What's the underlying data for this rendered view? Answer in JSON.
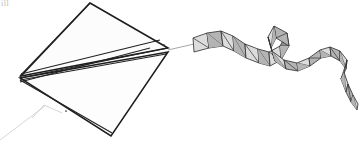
{
  "canvas": {
    "width": 360,
    "height": 142,
    "background": "#ffffff"
  },
  "artwork": {
    "title": "Kite with twisting ribbon tail",
    "medium": "pencil line drawing",
    "corner_mark": "ill",
    "palette": {
      "ink": "#1d1d1d",
      "ink_soft": "#3a3a3a",
      "facet_light": "#dcdcdc",
      "facet_mid": "#b4b4b4",
      "facet_dark": "#909090",
      "sail_fill": "#fcfcfc",
      "flying_line": "#d2d2d2",
      "bridle_line": "#c9c9c9"
    }
  },
  "kite": {
    "name": "delta kite sail",
    "outline_points": "90,3 168,48 111,136 20,78",
    "upper_panel_points": "90,3 168,48 21,76",
    "lower_panel_points": "20,78 168,52 111,136",
    "left_vertex": "20,78",
    "top_vertex": "90,3",
    "right_vertex": "168,48",
    "bottom_vertex": "111,136",
    "spars": [
      {
        "name": "spine-spar",
        "from": "20,78",
        "to": "168,48"
      },
      {
        "name": "upper-leading-edge",
        "from": "20,76",
        "to": "90,3"
      },
      {
        "name": "upper-chord-spar",
        "from": "21,74",
        "to": "160,40"
      },
      {
        "name": "mid-chord-spar",
        "from": "20,80",
        "to": "166,54"
      },
      {
        "name": "lower-cross-spar",
        "from": "20,82",
        "to": "150,48"
      },
      {
        "name": "lower-trailing-spar",
        "from": "21,84",
        "to": "111,134"
      },
      {
        "name": "keel-edge",
        "from": "20,80",
        "to": "112,133"
      }
    ],
    "anchor_dots": [
      {
        "name": "anchor-dot-right-upper",
        "at": "164,45"
      },
      {
        "name": "anchor-dot-right-lower",
        "at": "166,54"
      },
      {
        "name": "anchor-dot-keel",
        "at": "66,111"
      }
    ]
  },
  "bridle": {
    "name": "bridle triangle",
    "apex": "44,105",
    "left_leg": "44,105 32,118",
    "right_leg": "44,105 62,113",
    "base": "32,118 62,113"
  },
  "flying_line": {
    "name": "flying line to handler",
    "from": "45,106",
    "to": "0,140"
  },
  "tail": {
    "name": "faceted ribbon tail",
    "attachment_line": {
      "from": "168,50",
      "to": "194,44"
    },
    "segment_count": 22,
    "facet_quads": [
      {
        "id": 1,
        "points": "193,38 207,33 209,48 194,52",
        "tone": "facet_light"
      },
      {
        "id": 2,
        "points": "207,33 221,31 223,46 209,48",
        "tone": "facet_mid"
      },
      {
        "id": 3,
        "points": "221,31 233,36 234,51 223,46",
        "tone": "facet_light"
      },
      {
        "id": 4,
        "points": "233,36 245,44 246,58 234,51",
        "tone": "facet_mid"
      },
      {
        "id": 5,
        "points": "245,44 258,49 259,63 246,58",
        "tone": "facet_light"
      },
      {
        "id": 6,
        "points": "258,49 269,52 270,66 259,63",
        "tone": "facet_mid"
      },
      {
        "id": 7,
        "points": "269,52 280,46 281,60 270,66",
        "tone": "facet_light"
      },
      {
        "id": 8,
        "points": "280,46 287,33 289,46 281,60",
        "tone": "facet_dark"
      },
      {
        "id": 9,
        "points": "287,33 274,26 276,38 289,46",
        "tone": "facet_mid"
      },
      {
        "id": 10,
        "points": "274,26 268,37 271,48 276,38",
        "tone": "facet_light"
      },
      {
        "id": 11,
        "points": "268,37 272,51 275,61 271,48",
        "tone": "facet_mid"
      },
      {
        "id": 12,
        "points": "272,51 284,60 286,69 275,61",
        "tone": "facet_light"
      },
      {
        "id": 13,
        "points": "284,60 297,63 298,71 286,69",
        "tone": "facet_mid"
      },
      {
        "id": 14,
        "points": "297,63 309,58 310,66 298,71",
        "tone": "facet_light"
      },
      {
        "id": 15,
        "points": "309,58 320,50 321,58 310,66",
        "tone": "facet_mid"
      },
      {
        "id": 16,
        "points": "320,50 330,47 331,56 321,58",
        "tone": "facet_light"
      },
      {
        "id": 17,
        "points": "330,47 340,51 340,61 331,56",
        "tone": "facet_mid"
      },
      {
        "id": 18,
        "points": "340,51 347,60 346,69 340,61",
        "tone": "facet_light"
      },
      {
        "id": 19,
        "points": "347,60 344,72 341,79 346,69",
        "tone": "facet_mid"
      },
      {
        "id": 20,
        "points": "344,72 348,84 346,92 341,79",
        "tone": "facet_light"
      },
      {
        "id": 21,
        "points": "348,84 353,95 351,102 346,92",
        "tone": "facet_mid"
      },
      {
        "id": 22,
        "points": "353,95 358,104 357,110 351,102",
        "tone": "facet_light"
      }
    ]
  }
}
